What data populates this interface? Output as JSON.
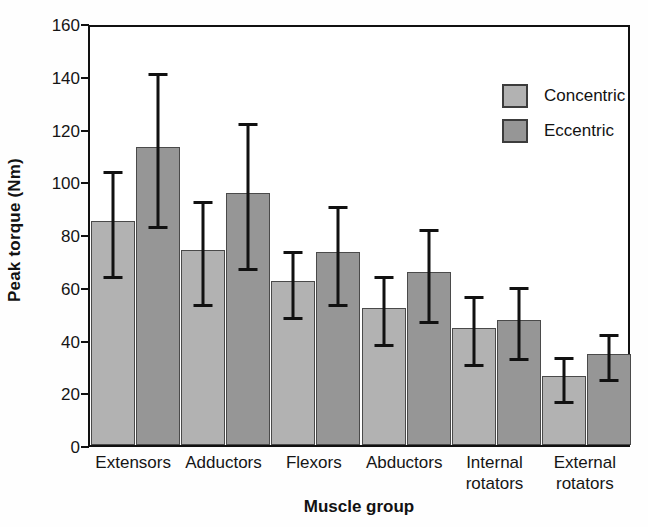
{
  "chart_data": {
    "type": "bar",
    "title": "",
    "xlabel": "Muscle group",
    "ylabel": "Peak torque (Nm)",
    "ylim": [
      0,
      160
    ],
    "yticks": [
      0,
      20,
      40,
      60,
      80,
      100,
      120,
      140,
      160
    ],
    "grid": false,
    "legend_position": "top-right",
    "categories": [
      "Extensors",
      "Adductors",
      "Flexors",
      "Abductors",
      "Internal\nrotators",
      "External\nrotators"
    ],
    "series": [
      {
        "name": "Concentric",
        "color": "#b2b2b2",
        "values": [
          85,
          74,
          62,
          52,
          44.5,
          26
        ],
        "errors": [
          20.5,
          20,
          13,
          13.5,
          13.5,
          9
        ]
      },
      {
        "name": "Eccentric",
        "color": "#969696",
        "values": [
          113,
          95.5,
          73,
          65.5,
          47.5,
          34.5
        ],
        "errors": [
          29.5,
          28,
          19,
          18,
          14,
          9
        ]
      }
    ]
  },
  "axis": {
    "y_title": "Peak torque (Nm)",
    "x_title": "Muscle group",
    "y_tick_labels": [
      "0",
      "20",
      "40",
      "60",
      "80",
      "100",
      "120",
      "140",
      "160"
    ],
    "x_tick_labels": [
      "Extensors",
      "Adductors",
      "Flexors",
      "Abductors",
      "Internal\nrotators",
      "External\nrotators"
    ]
  },
  "legend": {
    "items": [
      {
        "label": "Concentric",
        "color": "#b2b2b2"
      },
      {
        "label": "Eccentric",
        "color": "#969696"
      }
    ]
  },
  "colors": {
    "concentric": "#b2b2b2",
    "eccentric": "#969696",
    "axis": "#111111",
    "background": "#ffffff"
  }
}
